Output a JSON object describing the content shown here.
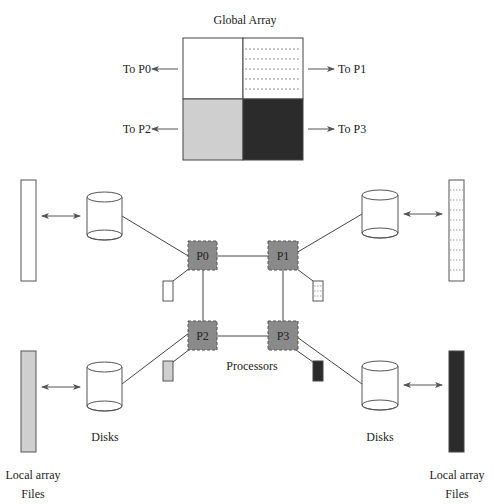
{
  "title": "Global Array",
  "colors": {
    "stroke": "#444444",
    "light_gray": "#cfcfcf",
    "dark": "#2b2b2b",
    "processor_fill": "#8a8a8a",
    "dotted": "#666666",
    "background": "#ffffff"
  },
  "global_array": {
    "label": "Global Array",
    "quadrants": [
      {
        "id": "q0",
        "fill": "white",
        "target": "To P0"
      },
      {
        "id": "q1",
        "fill": "dotted",
        "target": "To P1"
      },
      {
        "id": "q2",
        "fill": "light_gray",
        "target": "To P2"
      },
      {
        "id": "q3",
        "fill": "dark",
        "target": "To P3"
      }
    ]
  },
  "arrow_labels": {
    "p0": "To P0",
    "p1": "To P1",
    "p2": "To P2",
    "p3": "To P3"
  },
  "processors": {
    "label": "Processors",
    "items": [
      {
        "id": "P0",
        "label": "P0"
      },
      {
        "id": "P1",
        "label": "P1"
      },
      {
        "id": "P2",
        "label": "P2"
      },
      {
        "id": "P3",
        "label": "P3"
      }
    ]
  },
  "disks": {
    "label_left": "Disks",
    "label_right": "Disks"
  },
  "local_files": {
    "label_left_line1": "Local array",
    "label_left_line2": "Files",
    "label_right_line1": "Local array",
    "label_right_line2": "Files"
  }
}
